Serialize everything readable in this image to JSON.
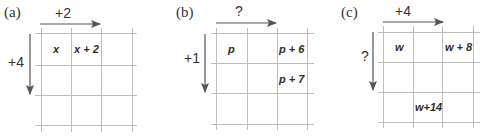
{
  "panels": [
    {
      "label": "(a)",
      "horizontal_step": "+2",
      "vertical_step": "+4",
      "cells": [
        {
          "row": 0,
          "col": 0,
          "text": "x"
        },
        {
          "row": 0,
          "col": 1,
          "text": "x + 2"
        }
      ]
    },
    {
      "label": "(b)",
      "horizontal_step": "?",
      "vertical_step": "+1",
      "cells": [
        {
          "row": 0,
          "col": 0,
          "text": "p"
        },
        {
          "row": 0,
          "col": 2,
          "text": "p + 6"
        },
        {
          "row": 1,
          "col": 2,
          "text": "p + 7"
        }
      ]
    },
    {
      "label": "(c)",
      "horizontal_step": "+4",
      "vertical_step": "?",
      "cells": [
        {
          "row": 0,
          "col": 0,
          "text": "w"
        },
        {
          "row": 0,
          "col": 2,
          "text": "w + 8"
        },
        {
          "row": 2,
          "col": 1,
          "text": "w+14"
        }
      ]
    }
  ],
  "colors": {
    "grid_line": "#bdbdbd",
    "arrow": "#555555",
    "text": "#2e2e2e"
  }
}
